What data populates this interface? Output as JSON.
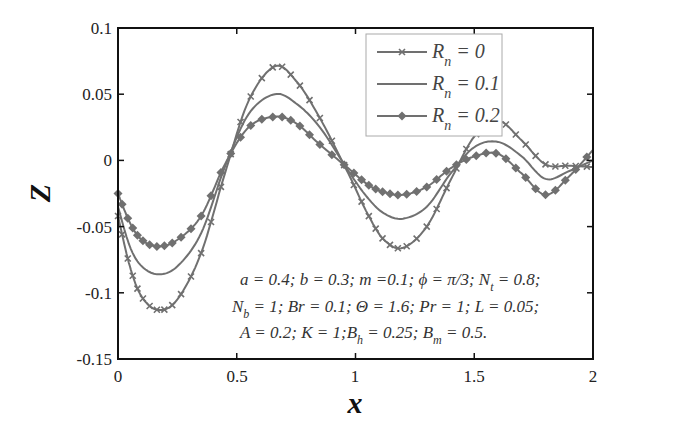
{
  "chart_data": {
    "type": "line",
    "title": "",
    "xlabel": "x",
    "ylabel": "Z",
    "xlim": [
      0,
      2
    ],
    "ylim": [
      -0.15,
      0.1
    ],
    "grid": false,
    "legend_position": "upper center (inside)",
    "x_ticks": [
      "0",
      "0.5",
      "1",
      "1.5",
      "2"
    ],
    "y_ticks": [
      "0.1",
      "0.05",
      "0",
      "-0.05",
      "-0.1",
      "-0.15"
    ],
    "x": [
      0,
      0.05,
      0.1,
      0.17,
      0.25,
      0.35,
      0.45,
      0.55,
      0.66,
      0.75,
      0.85,
      0.97,
      1.05,
      1.12,
      1.2,
      1.3,
      1.4,
      1.5,
      1.6,
      1.7,
      1.8,
      1.9,
      2.0
    ],
    "series": [
      {
        "name": "R_n = 0",
        "marker": "x",
        "values": [
          -0.042,
          -0.08,
          -0.103,
          -0.113,
          -0.105,
          -0.07,
          -0.01,
          0.045,
          0.071,
          0.06,
          0.032,
          -0.01,
          -0.04,
          -0.06,
          -0.066,
          -0.05,
          -0.015,
          0.018,
          0.03,
          0.015,
          -0.003,
          -0.004,
          -0.005
        ]
      },
      {
        "name": "R_n = 0.1",
        "marker": "none",
        "values": [
          -0.035,
          -0.065,
          -0.08,
          -0.086,
          -0.08,
          -0.055,
          -0.005,
          0.035,
          0.05,
          0.043,
          0.025,
          -0.008,
          -0.028,
          -0.04,
          -0.044,
          -0.035,
          -0.01,
          0.01,
          0.014,
          0.003,
          -0.014,
          -0.008,
          0.0
        ]
      },
      {
        "name": "R_n = 0.2",
        "marker": "diamond",
        "values": [
          -0.025,
          -0.047,
          -0.06,
          -0.065,
          -0.06,
          -0.042,
          -0.003,
          0.025,
          0.033,
          0.028,
          0.012,
          -0.006,
          -0.018,
          -0.024,
          -0.026,
          -0.02,
          -0.006,
          0.003,
          0.005,
          -0.01,
          -0.026,
          -0.012,
          0.008
        ]
      }
    ],
    "annotation": [
      "a = 0.4; b = 0.3; m =0.1; ϕ = π/3; N_t = 0.8;",
      "N_b = 1; Br = 0.1; Θ = 1.6; Pr = 1; L = 0.05;",
      "A = 0.2; K = 1; B_h = 0.25; B_m = 0.5."
    ]
  },
  "labels": {
    "xlabel": "x",
    "ylabel": "Z",
    "x_ticks": [
      "0",
      "0.5",
      "1",
      "1.5",
      "2"
    ],
    "y_ticks": [
      "0.1",
      "0.05",
      "0",
      "-0.05",
      "-0.1",
      "-0.15"
    ]
  },
  "legend": [
    {
      "base": "R",
      "sub": "n",
      "value": " = 0"
    },
    {
      "base": "R",
      "sub": "n",
      "value": " = 0.1"
    },
    {
      "base": "R",
      "sub": "n",
      "value": " = 0.2"
    }
  ],
  "annotation": {
    "line1": {
      "a": "a = 0.4; b = 0.3; m =0.1; ϕ = π/3; N",
      "a_sub": "t",
      "a_end": " = 0.8;"
    },
    "line2": {
      "a": "N",
      "a_sub": "b",
      "a_end": " = 1; Br = 0.1; Θ = 1.6; Pr = 1; L = 0.05;"
    },
    "line3": {
      "a": "A = 0.2; K = 1;B",
      "a_sub": "h",
      "b": " = 0.25; B",
      "b_sub": "m",
      "b_end": " = 0.5."
    }
  },
  "colors": {
    "line": "#707070",
    "axis": "#111111",
    "legend_border": "#aaaaaa"
  }
}
